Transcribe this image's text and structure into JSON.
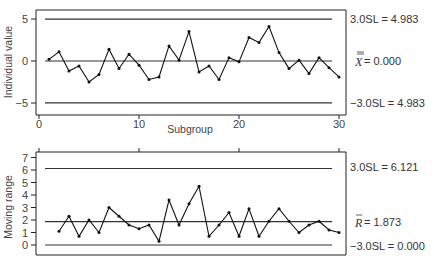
{
  "chart_data": [
    {
      "type": "line",
      "title": "",
      "xlabel": "Subgroup",
      "ylabel": "Individual value",
      "xlim": [
        0,
        31
      ],
      "ylim": [
        -6,
        6
      ],
      "xticks": [
        "0",
        "10",
        "20",
        "30"
      ],
      "yticks": [
        "5",
        "0",
        "-5"
      ],
      "grid": false,
      "x": [
        1,
        2,
        3,
        4,
        5,
        6,
        7,
        8,
        9,
        10,
        11,
        12,
        13,
        14,
        15,
        16,
        17,
        18,
        19,
        20,
        21,
        22,
        23,
        24,
        25,
        26,
        27,
        28,
        29,
        30
      ],
      "series": [
        {
          "name": "Individual value",
          "values": [
            0.2,
            1.1,
            -1.2,
            -0.6,
            -2.5,
            -1.6,
            1.4,
            -0.9,
            0.8,
            -0.5,
            -2.2,
            -1.9,
            1.8,
            0.1,
            3.5,
            -1.3,
            -0.6,
            -2.2,
            0.4,
            -0.1,
            2.8,
            2.2,
            4.1,
            1.0,
            -0.9,
            0.1,
            -1.5,
            0.4,
            -0.8,
            -1.9
          ]
        }
      ],
      "reference_lines": [
        {
          "name": "UCL",
          "value": 4.983,
          "label": "3.0SL = 4.983"
        },
        {
          "name": "Center",
          "value": 0.0,
          "label_symbol": "X",
          "label_suffix": " = 0.000"
        },
        {
          "name": "LCL",
          "value": -4.983,
          "label": "-3.0SL = 4.983"
        }
      ]
    },
    {
      "type": "line",
      "title": "",
      "xlabel": "",
      "ylabel": "Moving range",
      "xlim": [
        0,
        31
      ],
      "ylim": [
        -0.5,
        7
      ],
      "yticks": [
        "7",
        "6",
        "5",
        "4",
        "3",
        "2",
        "1",
        "0"
      ],
      "grid": false,
      "x": [
        2,
        3,
        4,
        5,
        6,
        7,
        8,
        9,
        10,
        11,
        12,
        13,
        14,
        15,
        16,
        17,
        18,
        19,
        20,
        21,
        22,
        23,
        24,
        25,
        26,
        27,
        28,
        29,
        30
      ],
      "series": [
        {
          "name": "Moving range",
          "values": [
            1.1,
            2.3,
            0.7,
            2.0,
            1.0,
            3.0,
            2.3,
            1.6,
            1.3,
            1.6,
            0.3,
            3.6,
            1.6,
            3.3,
            4.7,
            0.7,
            1.6,
            2.6,
            0.7,
            2.9,
            0.7,
            1.9,
            2.9,
            1.9,
            1.0,
            1.6,
            1.9,
            1.2,
            1.0
          ]
        }
      ],
      "reference_lines": [
        {
          "name": "UCL",
          "value": 6.121,
          "label": "3.0SL = 6.121"
        },
        {
          "name": "Center",
          "value": 1.873,
          "label_symbol": "R",
          "label_suffix": " = 1.873"
        },
        {
          "name": "LCL",
          "value": 0.0,
          "label": "-3.0SL = 0.000"
        }
      ]
    }
  ],
  "labels": {
    "top_ylabel": "Individual value",
    "top_xlabel": "Subgroup",
    "top_ucl": "3.0SL = 4.983",
    "top_center_symbol": "X",
    "top_center_value": " = 0.000",
    "top_lcl": "−3.0SL = 4.983",
    "top_yticks": [
      "5",
      "0",
      "−5"
    ],
    "top_xticks": [
      "0",
      "10",
      "20",
      "30"
    ],
    "bottom_ylabel": "Moving range",
    "bottom_ucl": "3.0SL = 6.121",
    "bottom_center_symbol": "R",
    "bottom_center_value": " = 1.873",
    "bottom_lcl": "−3.0SL = 0.000",
    "bottom_yticks": [
      "7",
      "6",
      "5",
      "4",
      "3",
      "2",
      "1",
      "0"
    ]
  }
}
